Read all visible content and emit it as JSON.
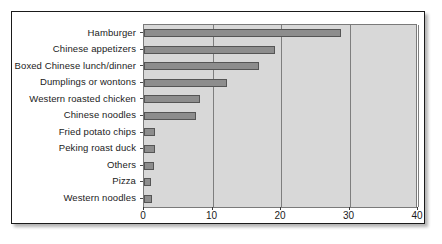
{
  "chart_data": {
    "type": "bar",
    "orientation": "horizontal",
    "title": "",
    "xlabel": "",
    "ylabel": "",
    "categories": [
      "Hamburger",
      "Chinese appetizers",
      "Boxed Chinese lunch/dinner",
      "Dumplings or wontons",
      "Western roasted chicken",
      "Chinese noodles",
      "Fried potato chips",
      "Peking roast duck",
      "Others",
      "Pizza",
      "Western noodles"
    ],
    "values": [
      28.7,
      19.1,
      16.8,
      12.1,
      8.2,
      7.6,
      1.6,
      1.6,
      1.4,
      1.0,
      1.1
    ],
    "xlim": [
      0,
      40
    ],
    "xticks": [
      0,
      10,
      20,
      30,
      40
    ],
    "xtick_labels": [
      "0",
      "10",
      "20",
      "30",
      "40"
    ],
    "grid": "vertical",
    "legend": "none",
    "colors": {
      "bar_fill": "#8d8d8d",
      "bar_edge": "#555555",
      "plot_background": "#d8d8d8",
      "gridline": "#7e7e7e",
      "figure_border": "#1a1a1a",
      "text": "#1b1b1b"
    }
  }
}
